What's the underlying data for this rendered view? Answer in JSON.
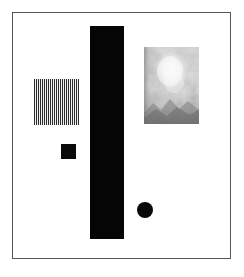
{
  "artwork": {
    "title": "Abstract Geometric Composition",
    "background_color": "#ffffff",
    "frame": {
      "border_color": "#54565a",
      "border_width_px": 1,
      "x": 12,
      "y": 12,
      "width": 219,
      "height": 247,
      "fill_color": "#ffffff"
    },
    "elements": [
      {
        "name": "striped-block",
        "shape": "rectangle",
        "pattern": "vertical-stripes",
        "stripe_dark_color": "#2b2b2b",
        "stripe_light_color": "#f2f2f2",
        "stripe_period_px": 2,
        "x": 33,
        "y": 78,
        "width": 45,
        "height": 46
      },
      {
        "name": "vertical-bar",
        "shape": "rectangle",
        "pattern": "solid",
        "fill_color": "#050505",
        "x": 89,
        "y": 25,
        "width": 34,
        "height": 213
      },
      {
        "name": "small-square",
        "shape": "square",
        "pattern": "solid",
        "fill_color": "#0a0a0a",
        "x": 60,
        "y": 143,
        "width": 15,
        "height": 15
      },
      {
        "name": "circle",
        "shape": "circle",
        "pattern": "solid",
        "fill_color": "#0a0a0a",
        "center_x": 144,
        "center_y": 209,
        "radius": 8
      },
      {
        "name": "texture-panel",
        "shape": "rectangle",
        "pattern": "grayscale-cloud-texture",
        "base_color": "#d8d8d8",
        "highlight_color": "#fbfbfb",
        "shadow_color": "#6f6f6f",
        "x": 143,
        "y": 46,
        "width": 55,
        "height": 77
      }
    ]
  }
}
